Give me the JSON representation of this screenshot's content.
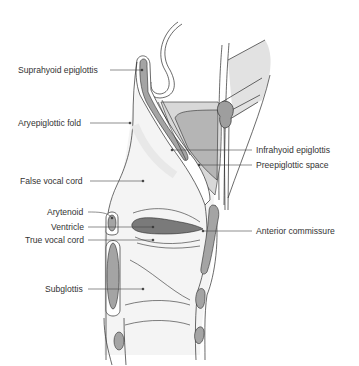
{
  "diagram": {
    "colors": {
      "outline": "#2b2b2b",
      "cartilage_fill": "#a8a8a8",
      "dark_fill": "#7a7a7a",
      "preepiglottic_fill": "#c6c6c6",
      "soft_tissue_fill": "#f2f2f2",
      "muscle_fill": "#e4e4e4",
      "leader_line": "#444444",
      "text": "#333333"
    },
    "labels": {
      "left": [
        {
          "id": "suprahyoid-epiglottis",
          "text": "Suprahyoid epiglottis"
        },
        {
          "id": "aryepiglottic-fold",
          "text": "Aryepiglottic fold"
        },
        {
          "id": "false-vocal-cord",
          "text": "False vocal cord"
        },
        {
          "id": "arytenoid",
          "text": "Arytenoid"
        },
        {
          "id": "ventricle",
          "text": "Ventricle"
        },
        {
          "id": "true-vocal-cord",
          "text": "True vocal cord"
        },
        {
          "id": "subglottis",
          "text": "Subglottis"
        }
      ],
      "right": [
        {
          "id": "infrahyoid-epiglottis",
          "text": "Infrahyoid epiglottis"
        },
        {
          "id": "preepiglottic-space",
          "text": "Preepiglottic space"
        },
        {
          "id": "anterior-commissure",
          "text": "Anterior commissure"
        }
      ]
    }
  }
}
